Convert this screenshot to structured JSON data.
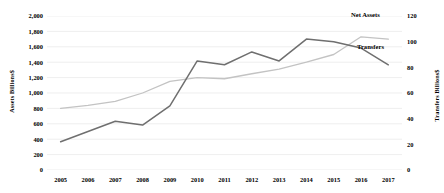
{
  "chart_data": {
    "type": "line",
    "title": "",
    "xlabel": "",
    "grid": true,
    "legend_position": "inline-annotation",
    "x": [
      "2005",
      "2006",
      "2007",
      "2008",
      "2009",
      "2010",
      "2011",
      "2012",
      "2013",
      "2014",
      "2015",
      "2016",
      "2017"
    ],
    "axes": {
      "left": {
        "label": "Assets Billions$",
        "ticks": [
          "0",
          "200",
          "400",
          "600",
          "800",
          "1,000",
          "1,200",
          "1,400",
          "1,600",
          "1,800",
          "2,000"
        ],
        "min": 0,
        "max": 2000,
        "step": 200
      },
      "right": {
        "label": "Transfers Billions$",
        "ticks": [
          "0",
          "20",
          "40",
          "60",
          "80",
          "100",
          "120"
        ],
        "min": 0,
        "max": 120,
        "step": 20
      }
    },
    "series": [
      {
        "name": "Net Assets",
        "axis": "left",
        "color": "#c3c3c3",
        "values": [
          800,
          840,
          890,
          1000,
          1150,
          1200,
          1185,
          1250,
          1310,
          1400,
          1500,
          1730,
          1700
        ]
      },
      {
        "name": "Transfers",
        "axis": "right",
        "color": "#6f6f6f",
        "values": [
          22,
          30,
          38,
          35,
          50,
          85,
          82,
          92,
          85,
          102,
          100,
          95,
          82
        ]
      }
    ],
    "annotations": [
      {
        "text": "Net Assets",
        "series": "Net Assets"
      },
      {
        "text": "Transfers",
        "series": "Transfers"
      }
    ]
  }
}
